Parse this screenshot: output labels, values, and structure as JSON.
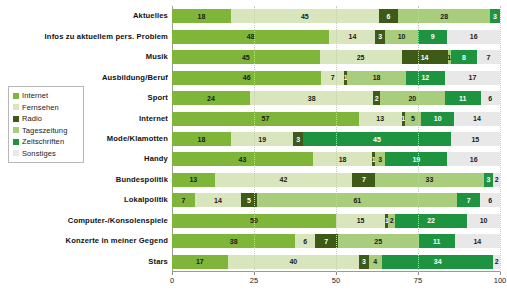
{
  "chart_data": {
    "type": "bar",
    "subtype": "stacked-bar-horizontal-100pct",
    "title": "",
    "xlabel": "",
    "ylabel": "",
    "xlim": [
      0,
      100
    ],
    "xticks": [
      0,
      25,
      50,
      75,
      100
    ],
    "xtick_labels": [
      "0",
      "25",
      "50",
      "75",
      "100"
    ],
    "grid": true,
    "legend_position": "left",
    "orientation": "horizontal",
    "categories": [
      "Aktuelles",
      "Infos zu aktuellem pers. Problem",
      "Musik",
      "Ausbildung/Beruf",
      "Sport",
      "Internet",
      "Mode/Klamotten",
      "Handy",
      "Bundespolitik",
      "Lokalpolitik",
      "Computer-/Konsolenspiele",
      "Konzerte in meiner Gegend",
      "Stars"
    ],
    "series": [
      {
        "name": "Internet",
        "color": "#7fb539",
        "label_color": "#1a1a1a",
        "values": [
          18,
          48,
          45,
          46,
          24,
          57,
          18,
          43,
          13,
          7,
          50,
          38,
          17
        ]
      },
      {
        "name": "Fernsehen",
        "color": "#d9e6bd",
        "label_color": "#1a1a1a",
        "values": [
          45,
          14,
          25,
          7,
          38,
          13,
          19,
          18,
          42,
          14,
          15,
          6,
          40
        ]
      },
      {
        "name": "Radio",
        "color": "#3d5a17",
        "label_color": "#ffffff",
        "values": [
          6,
          3,
          14,
          1,
          2,
          1,
          3,
          1,
          7,
          5,
          1,
          7,
          3
        ]
      },
      {
        "name": "Tageszeitung",
        "color": "#a8cd7c",
        "label_color": "#1a1a1a",
        "values": [
          28,
          10,
          1,
          18,
          20,
          5,
          0,
          3,
          33,
          61,
          2,
          25,
          4
        ]
      },
      {
        "name": "Zeitschriften",
        "color": "#1e9440",
        "label_color": "#ffffff",
        "values": [
          3,
          9,
          8,
          12,
          11,
          10,
          45,
          19,
          3,
          7,
          22,
          11,
          34
        ]
      },
      {
        "name": "Sonstiges",
        "color": "#e8e8e8",
        "label_color": "#1a1a1a",
        "values": [
          0,
          16,
          7,
          17,
          6,
          14,
          15,
          16,
          2,
          6,
          10,
          14,
          2
        ]
      }
    ]
  },
  "legend": {
    "items": [
      {
        "label": "Internet"
      },
      {
        "label": "Fernsehen"
      },
      {
        "label": "Radio"
      },
      {
        "label": "Tageszeitung"
      },
      {
        "label": "Zeitschriften"
      },
      {
        "label": "Sonstiges"
      }
    ]
  }
}
